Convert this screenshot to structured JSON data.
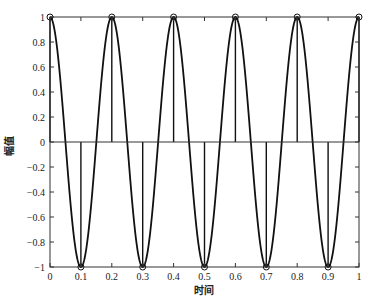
{
  "chart_data": {
    "type": "line",
    "title": "",
    "xlabel": "时间",
    "ylabel": "幅值",
    "xlim": [
      0,
      1
    ],
    "ylim": [
      -1,
      1
    ],
    "grid": false,
    "legend": null,
    "x_ticks": [
      0,
      0.1,
      0.2,
      0.3,
      0.4,
      0.5,
      0.6,
      0.7,
      0.8,
      0.9,
      1
    ],
    "x_tick_labels": [
      "0",
      "0.1",
      "0.2",
      "0.3",
      "0.4",
      "0.5",
      "0.6",
      "0.7",
      "0.8",
      "0.9",
      "1"
    ],
    "y_ticks": [
      -1,
      -0.8,
      -0.6,
      -0.4,
      -0.2,
      0,
      0.2,
      0.4,
      0.6,
      0.8,
      1
    ],
    "y_tick_labels": [
      "-1",
      "-0.8",
      "-0.6",
      "-0.4",
      "-0.2",
      "0",
      "0.2",
      "0.4",
      "0.6",
      "0.8",
      "1"
    ],
    "series": [
      {
        "name": "continuous",
        "style": "line",
        "function": "cos(2*pi*5*t)",
        "frequency_hz": 5
      },
      {
        "name": "samples",
        "style": "stem",
        "marker": "circle",
        "x": [
          0,
          0.1,
          0.2,
          0.3,
          0.4,
          0.5,
          0.6,
          0.7,
          0.8,
          0.9,
          1
        ],
        "values": [
          1,
          -1,
          1,
          -1,
          1,
          -1,
          1,
          -1,
          1,
          -1,
          1
        ]
      }
    ]
  },
  "colors": {
    "line": "#111111",
    "axes": "#333333",
    "background": "#ffffff"
  }
}
